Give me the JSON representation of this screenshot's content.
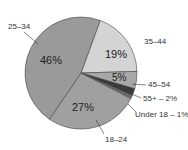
{
  "chart_data": {
    "type": "pie",
    "title": "",
    "slices": [
      {
        "label": "35–44",
        "value": 19,
        "pct_text": "19%",
        "color": "#d4d4d4"
      },
      {
        "label": "45–54",
        "value": 5,
        "pct_text": "5%",
        "color": "#a8a8a8"
      },
      {
        "label": "55+ – 2%",
        "value": 2,
        "pct_text": "",
        "color": "#3a3a3a"
      },
      {
        "label": "Under 18 – 1%",
        "value": 1,
        "pct_text": "",
        "color": "#6a6a6a"
      },
      {
        "label": "18–24",
        "value": 27,
        "pct_text": "27%",
        "color": "#a0a0a0"
      },
      {
        "label": "25–34",
        "value": 46,
        "pct_text": "46%",
        "color": "#9a9a9a"
      }
    ]
  }
}
